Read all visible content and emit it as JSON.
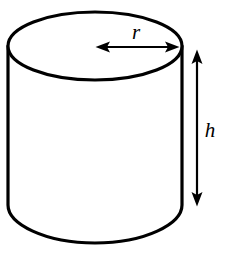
{
  "figure": {
    "name": "cylinder-with-radius-and-height-labels",
    "type": "geometric-solid-diagram",
    "shape": "cylinder",
    "background_color": "#ffffff",
    "stroke_color": "#000000",
    "fill_color": "#ffffff"
  },
  "labels": {
    "radius": {
      "text": "r",
      "style": "italic",
      "font_size_px": 21,
      "x": 136,
      "y": 39,
      "describes": "radius of the circular top face"
    },
    "height": {
      "text": "h",
      "style": "italic",
      "font_size_px": 21,
      "x": 210,
      "y": 137,
      "describes": "height of the cylinder"
    }
  },
  "geometry": {
    "top_ellipse": {
      "center_x": 95,
      "center_y": 46,
      "radius_x": 87,
      "radius_y": 34,
      "stroke_width": 3.2
    },
    "body": {
      "left_x": 8,
      "right_x": 182,
      "top_y": 46,
      "bottom_y": 209,
      "bottom_curve_depth": 34,
      "stroke_width": 3.2
    },
    "radius_arrow": {
      "orientation": "horizontal",
      "double_headed": true,
      "x_start": 96,
      "x_end": 179,
      "y": 47,
      "stroke_width": 2.2
    },
    "height_arrow": {
      "orientation": "vertical",
      "double_headed": true,
      "x": 197,
      "y_start": 50,
      "y_end": 206,
      "stroke_width": 2.2
    }
  },
  "colors": {
    "ink": "#000000",
    "paper": "#ffffff"
  }
}
